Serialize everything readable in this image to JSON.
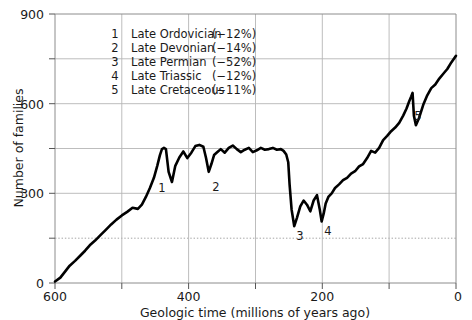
{
  "chart_data": {
    "type": "line",
    "title": "",
    "xlabel": "Geologic time (millions of years ago)",
    "ylabel": "Number of families",
    "xlim": [
      600,
      0
    ],
    "ylim": [
      0,
      900
    ],
    "x_reversed": true,
    "grid": true,
    "legend_position": "top-left inside plot",
    "x_ticks": [
      600,
      500,
      400,
      300,
      200,
      100,
      0
    ],
    "x_tick_labels": [
      "600",
      "",
      "400",
      "",
      "200",
      "",
      "0"
    ],
    "y_ticks": [
      0,
      150,
      300,
      450,
      600,
      750,
      900
    ],
    "y_tick_labels": [
      "0",
      "",
      "300",
      "",
      "600",
      "",
      "900"
    ],
    "series": [
      {
        "name": "Number of families",
        "x": [
          600,
          592,
          585,
          578,
          570,
          562,
          555,
          548,
          540,
          532,
          524,
          516,
          508,
          500,
          492,
          484,
          476,
          470,
          464,
          458,
          452,
          447,
          443,
          440,
          437,
          434,
          430,
          425,
          420,
          414,
          408,
          402,
          396,
          390,
          384,
          378,
          374,
          370,
          366,
          362,
          357,
          352,
          346,
          340,
          334,
          328,
          322,
          316,
          310,
          304,
          298,
          292,
          286,
          280,
          274,
          268,
          262,
          258,
          254,
          251,
          249,
          246,
          242,
          238,
          233,
          228,
          223,
          218,
          213,
          208,
          204,
          201,
          198,
          195,
          191,
          186,
          181,
          175,
          169,
          163,
          157,
          151,
          145,
          139,
          133,
          127,
          121,
          115,
          109,
          103,
          97,
          91,
          85,
          79,
          74,
          70,
          67,
          65,
          63,
          60,
          55,
          49,
          43,
          37,
          31,
          25,
          19,
          13,
          7,
          0
        ],
        "y": [
          5,
          18,
          38,
          58,
          74,
          92,
          108,
          126,
          142,
          160,
          178,
          196,
          212,
          226,
          238,
          252,
          248,
          262,
          288,
          318,
          352,
          392,
          428,
          448,
          452,
          448,
          372,
          338,
          392,
          420,
          440,
          418,
          436,
          458,
          462,
          456,
          418,
          372,
          398,
          428,
          438,
          448,
          436,
          452,
          460,
          448,
          438,
          446,
          452,
          438,
          444,
          452,
          446,
          448,
          452,
          446,
          448,
          442,
          430,
          404,
          330,
          246,
          190,
          218,
          256,
          276,
          262,
          240,
          276,
          294,
          248,
          206,
          232,
          266,
          288,
          300,
          318,
          330,
          344,
          352,
          366,
          374,
          390,
          398,
          418,
          442,
          436,
          452,
          478,
          492,
          508,
          520,
          536,
          560,
          584,
          608,
          624,
          636,
          560,
          528,
          554,
          596,
          628,
          652,
          664,
          684,
          700,
          716,
          738,
          760
        ],
        "color": "#000000",
        "linewidth": 2.6
      }
    ],
    "extinction_events": [
      {
        "number": "1",
        "name": "Late Ordovician",
        "magnitude": "(−12%)",
        "approx_time_ma": 440,
        "marker_x": 162,
        "marker_y": 192
      },
      {
        "number": "2",
        "name": "Late Devonian",
        "magnitude": "(−14%)",
        "approx_time_ma": 370,
        "marker_x": 216,
        "marker_y": 191
      },
      {
        "number": "3",
        "name": "Late Permian",
        "magnitude": "(−52%)",
        "approx_time_ma": 250,
        "marker_x": 300,
        "marker_y": 240
      },
      {
        "number": "4",
        "name": "Late Triassic",
        "magnitude": "(−12%)",
        "approx_time_ma": 201,
        "marker_x": 328,
        "marker_y": 235
      },
      {
        "number": "5",
        "name": "Late Cretaceous",
        "magnitude": "(−11%)",
        "approx_time_ma": 65,
        "marker_x": 418,
        "marker_y": 120
      }
    ]
  },
  "legend": {
    "rows": [
      {
        "num": "1",
        "name": "Late Ordovician",
        "pct": "(−12%)"
      },
      {
        "num": "2",
        "name": "Late Devonian",
        "pct": "(−14%)"
      },
      {
        "num": "3",
        "name": "Late Permian",
        "pct": "(−52%)"
      },
      {
        "num": "4",
        "name": "Late Triassic",
        "pct": "(−12%)"
      },
      {
        "num": "5",
        "name": "Late Cretaceous",
        "pct": "(−11%)"
      }
    ]
  },
  "axes": {
    "y_title": "Number of families",
    "x_title": "Geologic time (millions of years ago)",
    "y_labels": {
      "zero": "0",
      "three_hundred": "300",
      "six_hundred": "600",
      "nine_hundred": "900"
    },
    "x_labels": {
      "six_hundred": "600",
      "four_hundred": "400",
      "two_hundred": "200",
      "zero": "0"
    }
  },
  "markers": {
    "e1": "1",
    "e2": "2",
    "e3": "3",
    "e4": "4",
    "e5": "5"
  },
  "colors": {
    "curve": "#000000",
    "grid": "#b5b5b5",
    "frame": "#8c8c8c",
    "text": "#1a1a1a",
    "background": "#ffffff"
  }
}
